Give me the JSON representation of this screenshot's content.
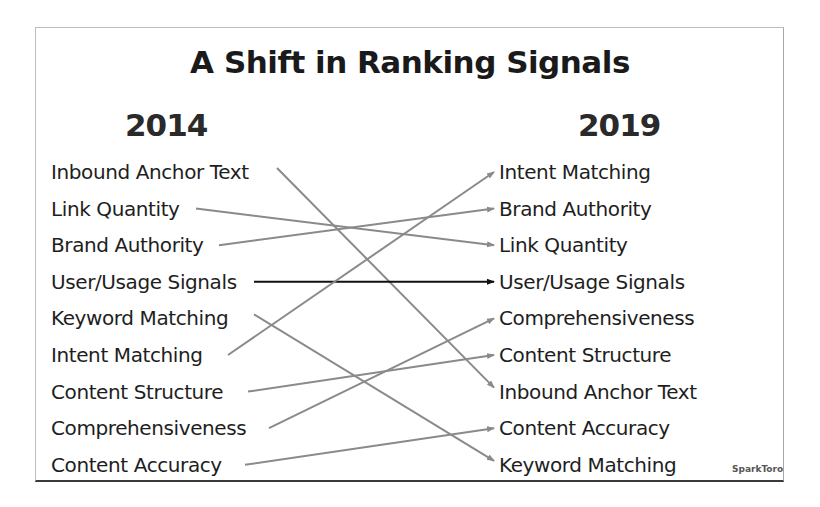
{
  "title": "A Shift in Ranking Signals",
  "columns": {
    "left_year": "2014",
    "right_year": "2019"
  },
  "left_items": [
    "Inbound Anchor Text",
    "Link Quantity",
    "Brand Authority",
    "User/Usage Signals",
    "Keyword Matching",
    "Intent Matching",
    "Content Structure",
    "Comprehensiveness",
    "Content Accuracy"
  ],
  "right_items": [
    "Intent Matching",
    "Brand Authority",
    "Link Quantity",
    "User/Usage Signals",
    "Comprehensiveness",
    "Content Structure",
    "Inbound Anchor Text",
    "Content Accuracy",
    "Keyword Matching"
  ],
  "connections": [
    {
      "from": 0,
      "to": 6,
      "from_x": 277,
      "color": "#8a8a8a"
    },
    {
      "from": 1,
      "to": 2,
      "from_x": 196,
      "color": "#8a8a8a"
    },
    {
      "from": 2,
      "to": 1,
      "from_x": 219,
      "color": "#8a8a8a"
    },
    {
      "from": 3,
      "to": 3,
      "from_x": 254,
      "color": "#111111"
    },
    {
      "from": 4,
      "to": 8,
      "from_x": 254,
      "color": "#8a8a8a"
    },
    {
      "from": 5,
      "to": 0,
      "from_x": 228,
      "color": "#8a8a8a"
    },
    {
      "from": 6,
      "to": 5,
      "from_x": 248,
      "color": "#8a8a8a"
    },
    {
      "from": 7,
      "to": 4,
      "from_x": 269,
      "color": "#8a8a8a"
    },
    {
      "from": 8,
      "to": 7,
      "from_x": 245,
      "color": "#8a8a8a"
    }
  ],
  "layout": {
    "row_y0": 172,
    "row_step": 36.6,
    "arrow_end_x": 494
  },
  "brand": "SparkToro"
}
